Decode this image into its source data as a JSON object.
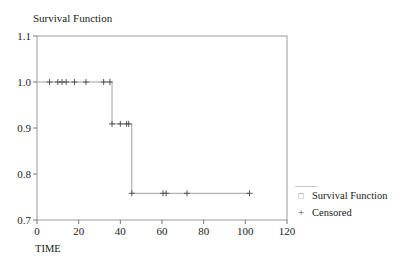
{
  "chart_data": {
    "type": "line",
    "subtype": "kaplan-meier-step",
    "title": "Survival Function",
    "xlabel": "TIME",
    "ylabel": "",
    "xlim": [
      0,
      120
    ],
    "ylim": [
      0.7,
      1.1
    ],
    "xticks": [
      0,
      20,
      40,
      60,
      80,
      100,
      120
    ],
    "yticks": [
      0.7,
      0.8,
      0.9,
      1.0,
      1.1
    ],
    "xtick_labels": [
      "0",
      "20",
      "40",
      "60",
      "80",
      "100",
      "120"
    ],
    "ytick_labels": [
      "0.7",
      "0.8",
      "0.9",
      "1.0",
      "1.1"
    ],
    "grid": false,
    "legend_position": "right-bottom",
    "series": [
      {
        "name": "Survival Function",
        "style": "step",
        "color": "#a0a0a0",
        "steps": [
          {
            "x": 0,
            "y": 1.0
          },
          {
            "x": 36,
            "y": 1.0
          },
          {
            "x": 36,
            "y": 0.909
          },
          {
            "x": 45.5,
            "y": 0.909
          },
          {
            "x": 45.5,
            "y": 0.758
          },
          {
            "x": 102,
            "y": 0.758
          }
        ]
      },
      {
        "name": "Censored",
        "style": "marker-plus",
        "color": "#555555",
        "points": [
          {
            "x": 6,
            "y": 1.0
          },
          {
            "x": 10,
            "y": 1.0
          },
          {
            "x": 12,
            "y": 1.0
          },
          {
            "x": 14,
            "y": 1.0
          },
          {
            "x": 18,
            "y": 1.0
          },
          {
            "x": 23.5,
            "y": 1.0
          },
          {
            "x": 32,
            "y": 1.0
          },
          {
            "x": 35,
            "y": 1.0
          },
          {
            "x": 36,
            "y": 0.909
          },
          {
            "x": 40,
            "y": 0.909
          },
          {
            "x": 43,
            "y": 0.909
          },
          {
            "x": 44,
            "y": 0.909
          },
          {
            "x": 45.5,
            "y": 0.758
          },
          {
            "x": 60.5,
            "y": 0.758
          },
          {
            "x": 62,
            "y": 0.758
          },
          {
            "x": 72,
            "y": 0.758
          },
          {
            "x": 102,
            "y": 0.758
          }
        ]
      }
    ]
  },
  "legend": {
    "items": [
      {
        "label": "Survival Function",
        "marker": "□"
      },
      {
        "label": "Censored",
        "marker": "+"
      }
    ]
  }
}
